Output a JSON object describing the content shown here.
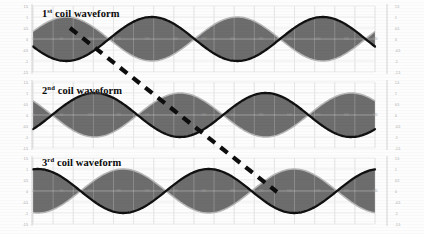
{
  "figure": {
    "background_color": "#fdfdfd",
    "width": 424,
    "height": 234
  },
  "panels": [
    {
      "id": "panel-1",
      "label_main": "coil waveform",
      "label_ordinal": "1",
      "label_superscript": "st",
      "label_full": "1st coil waveform",
      "label_x": 42,
      "label_y": 10,
      "plot": {
        "x": 33,
        "y": 6,
        "width": 342,
        "height": 66
      },
      "black_curve_phase_deg": 200,
      "envelope_phase_deg": 20,
      "faint_curve_phase_deg": 20
    },
    {
      "id": "panel-2",
      "label_main": "coil waveform",
      "label_ordinal": "2",
      "label_superscript": "nd",
      "label_full": "2nd coil waveform",
      "label_x": 42,
      "label_y": 86,
      "plot": {
        "x": 33,
        "y": 82,
        "width": 342,
        "height": 66
      },
      "black_curve_phase_deg": 320,
      "envelope_phase_deg": 140,
      "faint_curve_phase_deg": 140
    },
    {
      "id": "panel-3",
      "label_main": "coil waveform",
      "label_ordinal": "3",
      "label_superscript": "rd",
      "label_full": "3rd coil waveform",
      "label_x": 42,
      "label_y": 158,
      "plot": {
        "x": 33,
        "y": 158,
        "width": 342,
        "height": 66
      },
      "black_curve_phase_deg": 80,
      "envelope_phase_deg": 260,
      "faint_curve_phase_deg": 260
    }
  ],
  "chart_data": {
    "type": "line",
    "xlabel": "",
    "ylabel": "",
    "xlim": [
      0,
      720
    ],
    "ylim": [
      -1.5,
      1.5
    ],
    "grid": true,
    "legend": "none",
    "x_tick_labels": [
      "0",
      "60",
      "120",
      "180",
      "240",
      "300",
      "360",
      "420",
      "480",
      "540",
      "600",
      "660",
      "720"
    ],
    "y_tick_labels": [
      "1.5",
      "1",
      "0.5",
      "0",
      "-0.5",
      "-1",
      "-1.5"
    ],
    "y_ticks": [
      1.5,
      1,
      0.5,
      0,
      -0.5,
      -1,
      -1.5
    ],
    "axis_label_color": "#9a9a9a",
    "series": [
      {
        "name": "1st coil waveform",
        "panel": "panel-1",
        "style": "solid-black",
        "color": "#101010",
        "amplitude": 1.0,
        "phase_deg": 200,
        "cycles": 2
      },
      {
        "name": "1st coil envelope upper",
        "panel": "panel-1",
        "style": "filled-grey",
        "color": "#595959",
        "amplitude": 1.0,
        "phase_deg": 20,
        "cycles": 2
      },
      {
        "name": "1st coil envelope lower",
        "panel": "panel-1",
        "style": "filled-grey",
        "color": "#595959",
        "amplitude": -1.0,
        "phase_deg": 20,
        "cycles": 2
      },
      {
        "name": "2nd coil waveform",
        "panel": "panel-2",
        "style": "solid-black",
        "color": "#101010",
        "amplitude": 1.0,
        "phase_deg": 320,
        "cycles": 2
      },
      {
        "name": "2nd coil envelope upper",
        "panel": "panel-2",
        "style": "filled-grey",
        "color": "#595959",
        "amplitude": 1.0,
        "phase_deg": 140,
        "cycles": 2
      },
      {
        "name": "2nd coil envelope lower",
        "panel": "panel-2",
        "style": "filled-grey",
        "color": "#595959",
        "amplitude": -1.0,
        "phase_deg": 140,
        "cycles": 2
      },
      {
        "name": "3rd coil waveform",
        "panel": "panel-3",
        "style": "solid-black",
        "color": "#101010",
        "amplitude": 1.0,
        "phase_deg": 80,
        "cycles": 2
      },
      {
        "name": "3rd coil envelope upper",
        "panel": "panel-3",
        "style": "filled-grey",
        "color": "#595959",
        "amplitude": 1.0,
        "phase_deg": 260,
        "cycles": 2
      },
      {
        "name": "3rd coil envelope lower",
        "panel": "panel-3",
        "style": "filled-grey",
        "color": "#595959",
        "amplitude": -1.0,
        "phase_deg": 260,
        "cycles": 2
      }
    ],
    "annotations": [
      {
        "name": "phase-shift-indicator",
        "type": "dashed-line",
        "color": "#0d0d0d",
        "x1": 70,
        "y1": 28,
        "x2": 277,
        "y2": 192,
        "stroke_width": 4.2,
        "dash": "9 7"
      }
    ]
  },
  "colors": {
    "fill_grey": "#595959",
    "curve_black": "#101010",
    "faint_curve": "#b7b7b7",
    "grid": "#d8d8d8",
    "axis": "#c9c9c9",
    "tick_label": "#9a9a9a",
    "background": "#fdfdfd"
  }
}
